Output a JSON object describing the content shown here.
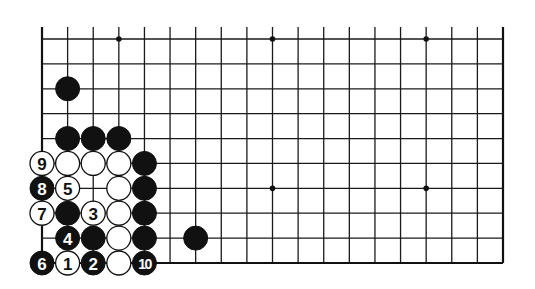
{
  "diagram": {
    "type": "go-board-diagram",
    "visible_columns": 19,
    "visible_rows": 10,
    "edges": {
      "top": false,
      "bottom": true,
      "left": true,
      "right": true
    },
    "colors": {
      "line": "#1a1a1a",
      "black_stone": "#111111",
      "white_stone": "#ffffff",
      "background": "#ffffff"
    },
    "star_points": [
      {
        "col": 3,
        "row": 0
      },
      {
        "col": 9,
        "row": 0
      },
      {
        "col": 15,
        "row": 0
      },
      {
        "col": 9,
        "row": 6
      },
      {
        "col": 15,
        "row": 6
      }
    ],
    "stones": [
      {
        "col": 1,
        "row": 2,
        "color": "black",
        "label": ""
      },
      {
        "col": 1,
        "row": 4,
        "color": "black",
        "label": ""
      },
      {
        "col": 2,
        "row": 4,
        "color": "black",
        "label": ""
      },
      {
        "col": 3,
        "row": 4,
        "color": "black",
        "label": ""
      },
      {
        "col": 0,
        "row": 5,
        "color": "white",
        "label": "9"
      },
      {
        "col": 1,
        "row": 5,
        "color": "white",
        "label": ""
      },
      {
        "col": 2,
        "row": 5,
        "color": "white",
        "label": ""
      },
      {
        "col": 3,
        "row": 5,
        "color": "white",
        "label": ""
      },
      {
        "col": 4,
        "row": 5,
        "color": "black",
        "label": ""
      },
      {
        "col": 0,
        "row": 6,
        "color": "black",
        "label": "8"
      },
      {
        "col": 1,
        "row": 6,
        "color": "white",
        "label": "5"
      },
      {
        "col": 3,
        "row": 6,
        "color": "white",
        "label": ""
      },
      {
        "col": 4,
        "row": 6,
        "color": "black",
        "label": ""
      },
      {
        "col": 0,
        "row": 7,
        "color": "white",
        "label": "7"
      },
      {
        "col": 1,
        "row": 7,
        "color": "black",
        "label": ""
      },
      {
        "col": 2,
        "row": 7,
        "color": "white",
        "label": "3"
      },
      {
        "col": 3,
        "row": 7,
        "color": "white",
        "label": ""
      },
      {
        "col": 4,
        "row": 7,
        "color": "black",
        "label": ""
      },
      {
        "col": 1,
        "row": 8,
        "color": "black",
        "label": "4"
      },
      {
        "col": 2,
        "row": 8,
        "color": "black",
        "label": ""
      },
      {
        "col": 3,
        "row": 8,
        "color": "white",
        "label": ""
      },
      {
        "col": 4,
        "row": 8,
        "color": "black",
        "label": ""
      },
      {
        "col": 6,
        "row": 8,
        "color": "black",
        "label": ""
      },
      {
        "col": 0,
        "row": 9,
        "color": "black",
        "label": "6"
      },
      {
        "col": 1,
        "row": 9,
        "color": "white",
        "label": "1"
      },
      {
        "col": 2,
        "row": 9,
        "color": "black",
        "label": "2"
      },
      {
        "col": 3,
        "row": 9,
        "color": "white",
        "label": ""
      },
      {
        "col": 4,
        "row": 9,
        "color": "black",
        "label": "10"
      }
    ],
    "move_sequence": [
      {
        "move": 1,
        "color": "white",
        "col": 1,
        "row": 9
      },
      {
        "move": 2,
        "color": "black",
        "col": 2,
        "row": 9
      },
      {
        "move": 3,
        "color": "white",
        "col": 2,
        "row": 7
      },
      {
        "move": 4,
        "color": "black",
        "col": 1,
        "row": 8
      },
      {
        "move": 5,
        "color": "white",
        "col": 1,
        "row": 6
      },
      {
        "move": 6,
        "color": "black",
        "col": 0,
        "row": 9
      },
      {
        "move": 7,
        "color": "white",
        "col": 0,
        "row": 7
      },
      {
        "move": 8,
        "color": "black",
        "col": 0,
        "row": 6
      },
      {
        "move": 9,
        "color": "white",
        "col": 0,
        "row": 5
      },
      {
        "move": 10,
        "color": "black",
        "col": 4,
        "row": 9
      }
    ]
  }
}
